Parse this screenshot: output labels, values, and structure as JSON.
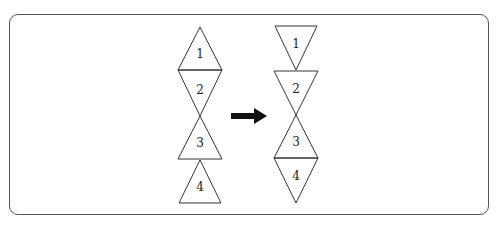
{
  "diagram": {
    "left_figure": {
      "triangles": [
        {
          "label": "1",
          "orientation": "up"
        },
        {
          "label": "2",
          "orientation": "down"
        },
        {
          "label": "3",
          "orientation": "up"
        },
        {
          "label": "4",
          "orientation": "up"
        }
      ]
    },
    "arrow": {
      "direction": "right"
    },
    "right_figure": {
      "triangles": [
        {
          "label": "1",
          "orientation": "down"
        },
        {
          "label": "2",
          "orientation": "down"
        },
        {
          "label": "3",
          "orientation": "up"
        },
        {
          "label": "4",
          "orientation": "down"
        }
      ]
    },
    "colors": {
      "stroke": "#333333",
      "arrow": "#111111",
      "frame": "#555555"
    }
  }
}
